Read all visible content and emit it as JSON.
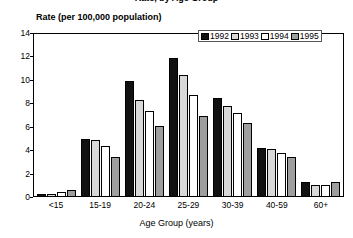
{
  "chart_data": {
    "type": "bar",
    "title": "Rate, by Age Group",
    "ylabel": "Rate (per 100,000 population)",
    "xlabel": "Age Group (years)",
    "categories": [
      "<15",
      "15-19",
      "20-24",
      "25-29",
      "30-39",
      "40-59",
      "60+"
    ],
    "series": [
      {
        "name": "1992",
        "color": "#111111",
        "values": [
          0.3,
          5.0,
          10.0,
          11.9,
          8.5,
          4.2,
          1.3
        ]
      },
      {
        "name": "1993",
        "color": "#d8d8d8",
        "values": [
          0.3,
          4.9,
          8.3,
          10.5,
          7.8,
          4.1,
          1.0
        ]
      },
      {
        "name": "1994",
        "color": "#ffffff",
        "values": [
          0.4,
          4.4,
          7.4,
          8.8,
          7.2,
          3.8,
          1.0
        ]
      },
      {
        "name": "1995",
        "color": "#9e9e9e",
        "values": [
          0.6,
          3.4,
          6.1,
          7.0,
          6.4,
          3.4,
          1.3
        ]
      }
    ],
    "ylim": [
      0,
      14
    ],
    "yticks": [
      0,
      2,
      4,
      6,
      8,
      10,
      12,
      14
    ],
    "grid": false,
    "legend_position": "top-right"
  }
}
